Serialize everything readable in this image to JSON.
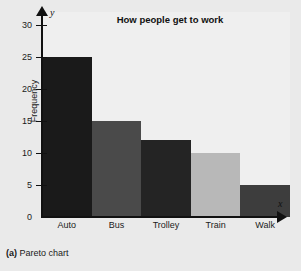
{
  "figure": {
    "caption_label": "(a)",
    "caption_text": " Pareto chart",
    "background_color": "#eaeaea",
    "plot_background_color": "#efefef"
  },
  "chart_data": {
    "type": "bar",
    "title": "How people get to work",
    "xlabel": "",
    "ylabel": "Frequency",
    "x_axis_variable": "x",
    "y_axis_variable": "y",
    "categories": [
      "Auto",
      "Bus",
      "Trolley",
      "Train",
      "Walk"
    ],
    "values": [
      25,
      15,
      12,
      10,
      5
    ],
    "bar_colors": [
      "#1a1a1a",
      "#4a4a4a",
      "#242424",
      "#b8b8b8",
      "#3d3d3d"
    ],
    "ylim": [
      0,
      32
    ],
    "yticks": [
      0,
      5,
      10,
      15,
      20,
      25,
      30
    ],
    "ytick_labels": [
      "0",
      "5",
      "10",
      "15",
      "20",
      "25",
      "30"
    ],
    "grid": false,
    "legend": "none"
  }
}
